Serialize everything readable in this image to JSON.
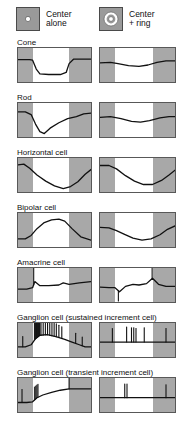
{
  "header": {
    "conditions": [
      {
        "id": "center-alone",
        "label": "Center\nalone",
        "icon": "center-spot-icon",
        "icon_desc": "gray square with small white center spot"
      },
      {
        "id": "center-plus-ring",
        "label": "Center\n+ ring",
        "icon": "center-ring-icon",
        "icon_desc": "gray square with white center spot surrounded by white annulus"
      }
    ]
  },
  "colors": {
    "stimulus_band": "#a8a8a8",
    "panel_border": "#585858",
    "trace": "#111111",
    "background": "#ffffff",
    "stimulus_icon_fill": "#9a9a9a"
  },
  "axes": {
    "stim_pre_fraction": 0.2,
    "stim_on_fraction": 0.5,
    "stim_post_fraction": 0.3,
    "note": "White band marks the period the light stimulus is ON; gray bands are darkness before and after."
  },
  "chart_data": {
    "type": "line",
    "xlabel": "Time",
    "ylabel": "Membrane potential / spike activity",
    "grid": false,
    "legend_position": "top",
    "columns": [
      "Center alone",
      "Center + ring"
    ],
    "rows": [
      {
        "label": "Cone",
        "center_alone": {
          "kind": "graded",
          "description": "sustained hyperpolarization during light, sharp onset and offset",
          "x": [
            0,
            0.16,
            0.2,
            0.25,
            0.3,
            0.42,
            0.58,
            0.66,
            0.7,
            0.76,
            1.0
          ],
          "y": [
            0.34,
            0.34,
            0.36,
            0.62,
            0.76,
            0.78,
            0.78,
            0.72,
            0.46,
            0.33,
            0.33
          ]
        },
        "center_plus_ring": {
          "kind": "graded",
          "description": "much reduced, shallow hyperpolarization",
          "x": [
            0,
            0.14,
            0.24,
            0.38,
            0.52,
            0.64,
            0.76,
            0.88,
            1.0
          ],
          "y": [
            0.44,
            0.42,
            0.46,
            0.52,
            0.54,
            0.5,
            0.42,
            0.38,
            0.38
          ]
        }
      },
      {
        "label": "Rod",
        "center_alone": {
          "kind": "graded",
          "description": "large fast hyperpolarization then slow recovery",
          "x": [
            0,
            0.1,
            0.18,
            0.24,
            0.3,
            0.36,
            0.44,
            0.56,
            0.68,
            0.8,
            0.9,
            1.0
          ],
          "y": [
            0.26,
            0.26,
            0.34,
            0.62,
            0.84,
            0.9,
            0.74,
            0.58,
            0.46,
            0.4,
            0.32,
            0.3
          ]
        },
        "center_plus_ring": {
          "kind": "graded",
          "description": "small shallow hyperpolarization",
          "x": [
            0,
            0.14,
            0.28,
            0.42,
            0.54,
            0.66,
            0.8,
            0.92,
            1.0
          ],
          "y": [
            0.42,
            0.4,
            0.46,
            0.54,
            0.56,
            0.52,
            0.44,
            0.4,
            0.4
          ]
        }
      },
      {
        "label": "Horizontal cell",
        "center_alone": {
          "kind": "graded",
          "description": "slow broad hyperpolarization peaking late, partial recovery",
          "x": [
            0,
            0.08,
            0.16,
            0.26,
            0.38,
            0.5,
            0.62,
            0.72,
            0.82,
            0.92,
            1.0
          ],
          "y": [
            0.2,
            0.18,
            0.3,
            0.5,
            0.68,
            0.82,
            0.9,
            0.84,
            0.7,
            0.48,
            0.34
          ]
        },
        "center_plus_ring": {
          "kind": "graded",
          "description": "similar slow hyperpolarization, somewhat smaller",
          "x": [
            0,
            0.12,
            0.22,
            0.34,
            0.46,
            0.58,
            0.7,
            0.82,
            0.92,
            1.0
          ],
          "y": [
            0.22,
            0.22,
            0.32,
            0.52,
            0.68,
            0.78,
            0.78,
            0.66,
            0.5,
            0.36
          ]
        }
      },
      {
        "label": "Bipolar cell",
        "center_alone": {
          "kind": "graded",
          "description": "large sustained depolarization during light (ON bipolar)",
          "x": [
            0,
            0.1,
            0.18,
            0.26,
            0.36,
            0.46,
            0.56,
            0.64,
            0.74,
            0.86,
            1.0
          ],
          "y": [
            0.76,
            0.76,
            0.66,
            0.46,
            0.28,
            0.2,
            0.18,
            0.24,
            0.46,
            0.7,
            0.8
          ]
        },
        "center_plus_ring": {
          "kind": "graded",
          "description": "response inverted/suppressed by surround ring",
          "x": [
            0,
            0.12,
            0.22,
            0.32,
            0.44,
            0.56,
            0.68,
            0.8,
            0.9,
            1.0
          ],
          "y": [
            0.42,
            0.44,
            0.52,
            0.62,
            0.74,
            0.8,
            0.76,
            0.64,
            0.48,
            0.38
          ]
        }
      },
      {
        "label": "Amacrine cell",
        "center_alone": {
          "kind": "graded-with-spike",
          "description": "transient depolarizing spike at light onset then slow decay",
          "spikes": [
            {
              "x": 0.215,
              "height": 0.82
            }
          ],
          "x": [
            0,
            0.12,
            0.2,
            0.23,
            0.3,
            0.42,
            0.56,
            0.62,
            0.7,
            0.84,
            1.0
          ],
          "y": [
            0.62,
            0.62,
            0.58,
            0.4,
            0.52,
            0.52,
            0.5,
            0.44,
            0.48,
            0.44,
            0.4
          ]
        },
        "center_plus_ring": {
          "kind": "graded-with-spike",
          "description": "small notch at onset, large transient spike at light offset",
          "spikes": [
            {
              "x": 0.245,
              "height": -0.3
            },
            {
              "x": 0.695,
              "height": 0.88
            }
          ],
          "x": [
            0,
            0.12,
            0.2,
            0.26,
            0.34,
            0.44,
            0.52,
            0.62,
            0.7,
            0.78,
            0.88,
            1.0
          ],
          "y": [
            0.56,
            0.58,
            0.58,
            0.7,
            0.54,
            0.48,
            0.5,
            0.46,
            0.3,
            0.48,
            0.54,
            0.54
          ]
        }
      },
      {
        "label": "Ganglion cell (sustained increment cell)",
        "center_alone": {
          "kind": "spike-train",
          "description": "dense high-frequency burst at onset continuing as sustained firing on a depolarizing hump",
          "baseline_x": [
            0,
            0.1,
            0.18,
            0.24,
            0.3,
            0.4,
            0.52,
            0.64,
            0.74,
            0.84,
            0.92,
            1.0
          ],
          "baseline_y": [
            0.7,
            0.7,
            0.64,
            0.46,
            0.36,
            0.34,
            0.4,
            0.48,
            0.56,
            0.64,
            0.7,
            0.7
          ],
          "burst": {
            "from": 0.225,
            "to": 0.3,
            "count": 14,
            "height": 0.55
          },
          "spikes": [
            {
              "x": 0.065,
              "height": 0.3
            },
            {
              "x": 0.315,
              "height": 0.46
            },
            {
              "x": 0.345,
              "height": 0.46
            },
            {
              "x": 0.375,
              "height": 0.44
            },
            {
              "x": 0.405,
              "height": 0.44
            },
            {
              "x": 0.435,
              "height": 0.42
            },
            {
              "x": 0.465,
              "height": 0.4
            },
            {
              "x": 0.495,
              "height": 0.4
            },
            {
              "x": 0.525,
              "height": 0.38
            },
            {
              "x": 0.56,
              "height": 0.36
            },
            {
              "x": 0.6,
              "height": 0.34
            },
            {
              "x": 0.79,
              "height": 0.3
            },
            {
              "x": 0.88,
              "height": 0.26
            }
          ]
        },
        "center_plus_ring": {
          "kind": "spike-train",
          "description": "sparse isolated spikes, firing strongly suppressed by surround",
          "baseline_x": [
            0,
            1.0
          ],
          "baseline_y": [
            0.56,
            0.56
          ],
          "spikes": [
            {
              "x": 0.165,
              "height": 0.4
            },
            {
              "x": 0.355,
              "height": 0.44
            },
            {
              "x": 0.42,
              "height": 0.42
            },
            {
              "x": 0.45,
              "height": 0.42
            },
            {
              "x": 0.48,
              "height": 0.4
            },
            {
              "x": 0.59,
              "height": 0.42
            },
            {
              "x": 0.88,
              "height": 0.4
            }
          ]
        }
      },
      {
        "label": "Ganglion cell (transient increment cell)",
        "center_alone": {
          "kind": "spike-train",
          "description": "brief transient burst at light onset only, riding a slow depolarization",
          "baseline_x": [
            0,
            0.12,
            0.2,
            0.26,
            0.34,
            0.46,
            0.58,
            0.7,
            0.82,
            1.0
          ],
          "baseline_y": [
            0.72,
            0.72,
            0.7,
            0.58,
            0.5,
            0.42,
            0.36,
            0.32,
            0.32,
            0.32
          ],
          "burst": {
            "from": 0.225,
            "to": 0.275,
            "count": 5,
            "height": 0.38
          },
          "spikes": [
            {
              "x": 0.055,
              "height": 0.38
            },
            {
              "x": 0.7,
              "height": 0.42
            }
          ]
        },
        "center_plus_ring": {
          "kind": "spike-train",
          "description": "only two or three isolated spikes; response nearly abolished",
          "baseline_x": [
            0,
            1.0
          ],
          "baseline_y": [
            0.58,
            0.58
          ],
          "spikes": [
            {
              "x": 0.33,
              "height": 0.4
            },
            {
              "x": 0.36,
              "height": 0.4
            },
            {
              "x": 0.88,
              "height": 0.38
            }
          ]
        }
      }
    ]
  }
}
